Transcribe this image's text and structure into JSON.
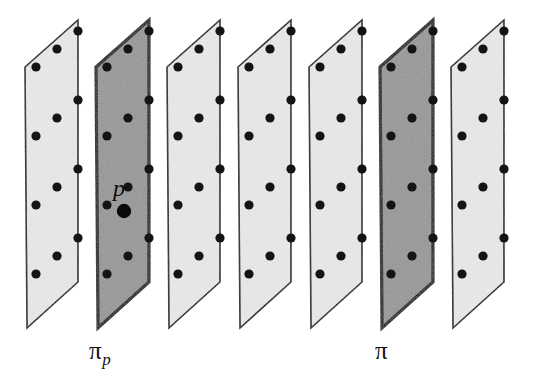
{
  "figure": {
    "width": 546,
    "height": 376,
    "background_color": "#ffffff",
    "plane_count": 7,
    "geometry": {
      "description": "Each plane is drawn as a slanted parallelogram seen edge-on in 3D perspective; planes are stacked left to right at equal horizontal spacing.",
      "plane_outline_points": "25,67 78,20 78,282 27,328",
      "horizontal_spacing": 71,
      "dot_columns": 3,
      "dot_rows": 4
    },
    "colors": {
      "plane_light_fill": "#e9e9e9",
      "plane_dark_fill": "#979797",
      "outline": "#1a1a1a",
      "outline_highlight": "#0d0d0d",
      "dot": "#141414"
    },
    "planes": [
      {
        "index": 1,
        "shaded": false,
        "label": "",
        "offset_x": 0
      },
      {
        "index": 2,
        "shaded": true,
        "label": "pi_p",
        "offset_x": 71
      },
      {
        "index": 3,
        "shaded": false,
        "label": "",
        "offset_x": 142
      },
      {
        "index": 4,
        "shaded": false,
        "label": "",
        "offset_x": 213
      },
      {
        "index": 5,
        "shaded": false,
        "label": "",
        "offset_x": 284
      },
      {
        "index": 6,
        "shaded": true,
        "label": "pi",
        "offset_x": 355
      },
      {
        "index": 7,
        "shaded": false,
        "label": "",
        "offset_x": 426
      }
    ],
    "dot_offsets": [
      {
        "x": 11,
        "y": 56
      },
      {
        "x": 32,
        "y": 38
      },
      {
        "x": 53,
        "y": 20
      },
      {
        "x": 11,
        "y": 125
      },
      {
        "x": 32,
        "y": 107
      },
      {
        "x": 53,
        "y": 89
      },
      {
        "x": 11,
        "y": 194
      },
      {
        "x": 32,
        "y": 176
      },
      {
        "x": 53,
        "y": 158
      },
      {
        "x": 11,
        "y": 263
      },
      {
        "x": 32,
        "y": 245
      },
      {
        "x": 53,
        "y": 227
      }
    ],
    "dot_radius": 4.6,
    "labels": {
      "pi_p": {
        "base": "π",
        "subscript": "p",
        "x": 89,
        "y": 338
      },
      "pi": {
        "base": "π",
        "subscript": "",
        "x": 375,
        "y": 338
      },
      "point_p": {
        "text": "p",
        "x": 113,
        "y": 176,
        "marker_x": 124,
        "marker_y": 211,
        "marker_radius": 7.2
      }
    }
  }
}
